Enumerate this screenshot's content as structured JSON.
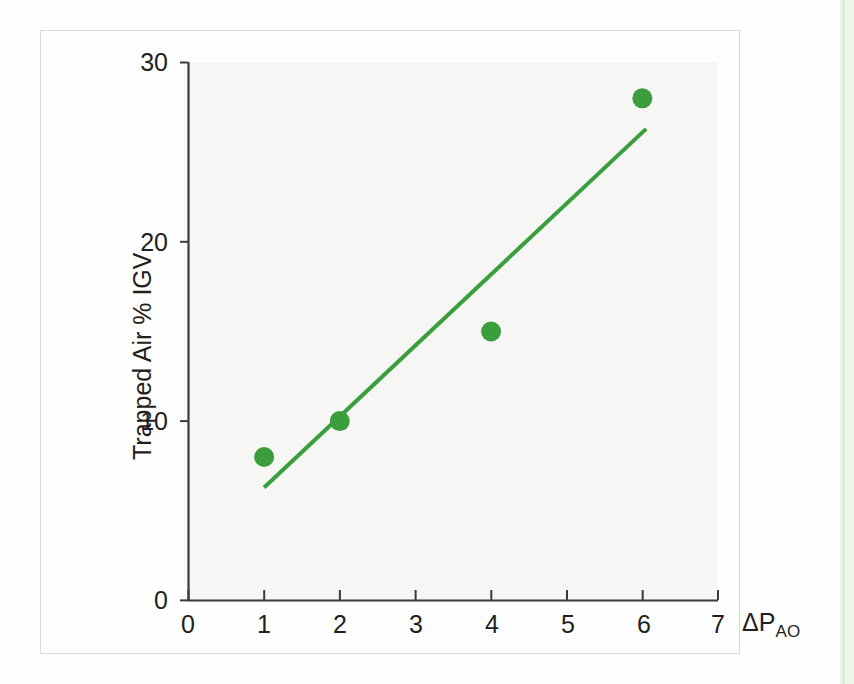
{
  "figure": {
    "background_color": "#fefefe",
    "plot_background_color": "#f6f6f5",
    "frame_color": "#d9dadb",
    "edge_strip_color": "#e7f2e4"
  },
  "axes": {
    "y_title": "Trapped Air % IGV",
    "x_title_main": "ΔP",
    "x_title_sub": "AO",
    "axis_color": "#3b3b3b"
  },
  "chart_data": {
    "type": "scatter",
    "title": "",
    "subtitle": "",
    "xlabel": "ΔP_AO",
    "ylabel": "Trapped Air % IGV",
    "xlim": [
      0,
      7
    ],
    "ylim": [
      0,
      30
    ],
    "xticks": [
      0,
      1,
      2,
      3,
      4,
      5,
      6,
      7
    ],
    "xtick_labels": [
      "0",
      "1",
      "2",
      "3",
      "4",
      "5",
      "6",
      "7"
    ],
    "yticks": [
      0,
      10,
      20,
      30
    ],
    "ytick_labels": [
      "0",
      "10",
      "20",
      "30"
    ],
    "grid": false,
    "legend": null,
    "legend_position": "none",
    "marker_color": "#3a9e3c",
    "marker_shape": "circle",
    "marker_size_px": 20,
    "series": [
      {
        "name": "Trapped Air % IGV",
        "x": [
          1,
          2,
          4,
          6
        ],
        "y": [
          8,
          10,
          15,
          28
        ],
        "points": [
          {
            "x": 1,
            "y": 8
          },
          {
            "x": 2,
            "y": 10
          },
          {
            "x": 4,
            "y": 15
          },
          {
            "x": 6,
            "y": 28
          }
        ]
      }
    ],
    "trendline": {
      "type": "line",
      "color": "#3a9e3c",
      "width_px": 4,
      "x_start": 1.0,
      "y_start": 6.3,
      "x_end": 6.05,
      "y_end": 26.3,
      "slope": 3.96,
      "intercept": 2.34
    },
    "annotations": []
  }
}
